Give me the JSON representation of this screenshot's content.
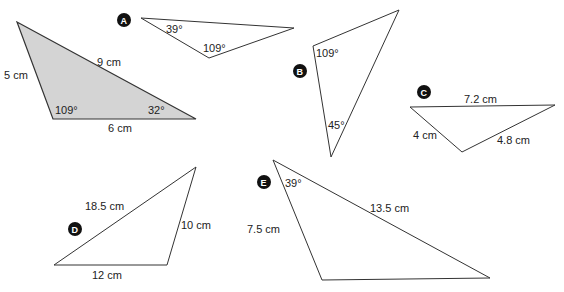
{
  "colors": {
    "shaded_fill": "#d4d4d4",
    "stroke": "#333333",
    "badge": "#111111"
  },
  "reference_triangle": {
    "sides": {
      "left": "5 cm",
      "top": "9 cm",
      "bottom": "6 cm"
    },
    "angles": {
      "bottom_left": "109°",
      "bottom_right": "32°"
    }
  },
  "triangles": [
    {
      "id": "A",
      "angles": [
        "39°",
        "109°"
      ]
    },
    {
      "id": "B",
      "angles": [
        "109°",
        "45°"
      ]
    },
    {
      "id": "C",
      "sides": [
        "7.2 cm",
        "4 cm",
        "4.8 cm"
      ]
    },
    {
      "id": "D",
      "sides": [
        "18.5 cm",
        "10 cm",
        "12 cm"
      ]
    },
    {
      "id": "E",
      "angles": [
        "39°"
      ],
      "sides": [
        "7.5 cm",
        "13.5 cm"
      ]
    }
  ]
}
